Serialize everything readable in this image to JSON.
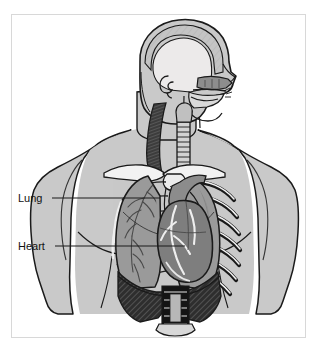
{
  "figure": {
    "domain": "Diagram",
    "frame": {
      "border_color": "#d8d8d8",
      "background_color": "#ffffff",
      "x": 11,
      "y": 14,
      "width": 295,
      "height": 324
    }
  },
  "labels": [
    {
      "id": "lung",
      "text": "Lung",
      "text_x": 18,
      "text_y": 202,
      "leader": {
        "x1": 52,
        "y1": 198,
        "x2": 160,
        "y2": 198
      }
    },
    {
      "id": "heart",
      "text": "Heart",
      "text_x": 18,
      "text_y": 250,
      "leader": {
        "x1": 55,
        "y1": 246,
        "x2": 185,
        "y2": 246
      }
    }
  ],
  "colors": {
    "outline": "#1a1a1a",
    "skin_fill": "#c9c9c9",
    "skin_shadow": "#b4b4b4",
    "skull_fill": "#b9b9b9",
    "brain_cavity": "#eceaea",
    "bone_white": "#f2f2f2",
    "lung_fill": "#9a9a9a",
    "heart_fill": "#7e7e7e",
    "muscle_dark": "#3c3c3c",
    "diaphragm_dark": "#2e2e2e",
    "spine_dark": "#141414",
    "label_text": "#111111",
    "leader_line": "#1a1a1a"
  },
  "structures": [
    {
      "id": "cranium",
      "name": "Cranium / skull vault"
    },
    {
      "id": "brain-cavity",
      "name": "Cranial cavity"
    },
    {
      "id": "ear",
      "name": "Ear canal"
    },
    {
      "id": "nasal-cavity",
      "name": "Nasal cavity"
    },
    {
      "id": "oral-cavity",
      "name": "Oral cavity / tongue"
    },
    {
      "id": "neck-muscle",
      "name": "Sternocleidomastoid muscle"
    },
    {
      "id": "trachea",
      "name": "Trachea"
    },
    {
      "id": "clavicle-left",
      "name": "Left clavicle"
    },
    {
      "id": "clavicle-right",
      "name": "Right clavicle"
    },
    {
      "id": "sternum",
      "name": "Sternum / manubrium"
    },
    {
      "id": "ribcage",
      "name": "Rib cage"
    },
    {
      "id": "lung-left",
      "name": "Left lung"
    },
    {
      "id": "lung-right",
      "name": "Right lung"
    },
    {
      "id": "bronchial-tree",
      "name": "Bronchial tree"
    },
    {
      "id": "heart",
      "name": "Heart"
    },
    {
      "id": "aorta",
      "name": "Aortic arch and great vessels"
    },
    {
      "id": "diaphragm",
      "name": "Diaphragm"
    },
    {
      "id": "spine",
      "name": "Vertebral column"
    }
  ]
}
